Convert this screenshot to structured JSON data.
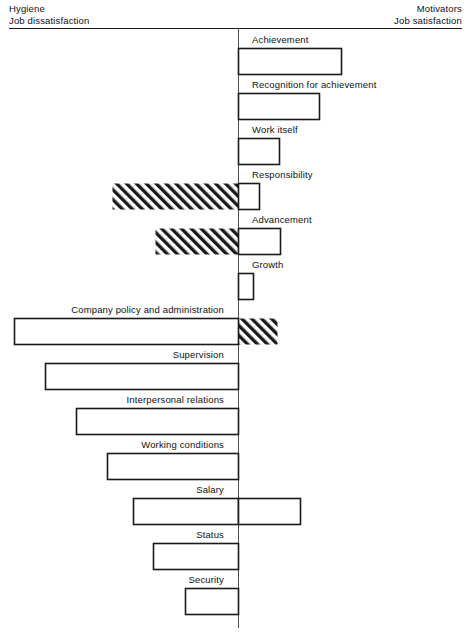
{
  "header": {
    "left_caption": "Hygiene\nJob dissatisfaction",
    "right_caption": "Motivators\nJob satisfaction"
  },
  "chart_data": {
    "type": "bar",
    "orientation": "horizontal-diverging",
    "title": "",
    "subtitle": "",
    "xlabel": "",
    "ylabel": "",
    "grid": false,
    "legend_position": "top-corners",
    "axis_center_label": "0",
    "legend": [
      {
        "name": "Job satisfaction (Motivators)",
        "fill": "white",
        "side": "right"
      },
      {
        "name": "Job dissatisfaction (Hygiene)",
        "fill": "white",
        "side": "left"
      },
      {
        "name": "Overlap / opposite effect",
        "fill": "hatched",
        "side": "either"
      }
    ],
    "categories": [
      "Achievement",
      "Recognition for achievement",
      "Work itself",
      "Responsibility",
      "Advancement",
      "Growth",
      "Company policy and administration",
      "Supervision",
      "Interpersonal relations",
      "Working conditions",
      "Salary",
      "Status",
      "Security"
    ],
    "bars": [
      {
        "label": "Achievement",
        "label_side": "right",
        "right": 103,
        "left": 0,
        "hatch_left": 0,
        "hatch_right": 0
      },
      {
        "label": "Recognition for achievement",
        "label_side": "right",
        "right": 81,
        "left": 0,
        "hatch_left": 0,
        "hatch_right": 0
      },
      {
        "label": "Work itself",
        "label_side": "right",
        "right": 41,
        "left": 0,
        "hatch_left": 0,
        "hatch_right": 0
      },
      {
        "label": "Responsibility",
        "label_side": "right",
        "right": 21,
        "left": 0,
        "hatch_left": 126,
        "hatch_right": 0
      },
      {
        "label": "Advancement",
        "label_side": "right",
        "right": 42,
        "left": 0,
        "hatch_left": 83,
        "hatch_right": 0
      },
      {
        "label": "Growth",
        "label_side": "right",
        "right": 15,
        "left": 0,
        "hatch_left": 0,
        "hatch_right": 0
      },
      {
        "label": "Company policy and administration",
        "label_side": "left",
        "right": 0,
        "left": 224,
        "hatch_left": 0,
        "hatch_right": 39
      },
      {
        "label": "Supervision",
        "label_side": "left",
        "right": 0,
        "left": 193,
        "hatch_left": 0,
        "hatch_right": 0
      },
      {
        "label": "Interpersonal relations",
        "label_side": "left",
        "right": 0,
        "left": 162,
        "hatch_left": 0,
        "hatch_right": 0
      },
      {
        "label": "Working conditions",
        "label_side": "left",
        "right": 0,
        "left": 131,
        "hatch_left": 0,
        "hatch_right": 0
      },
      {
        "label": "Salary",
        "label_side": "left",
        "right": 62,
        "left": 105,
        "hatch_left": 0,
        "hatch_right": 0
      },
      {
        "label": "Status",
        "label_side": "left",
        "right": 0,
        "left": 85,
        "hatch_left": 0,
        "hatch_right": 0
      },
      {
        "label": "Security",
        "label_side": "left",
        "right": 0,
        "left": 53,
        "hatch_left": 0,
        "hatch_right": 0
      }
    ],
    "axis_center_px": 238,
    "bar_height_px": 26,
    "row_pitch_px": 45,
    "first_bar_top_px": 35
  }
}
